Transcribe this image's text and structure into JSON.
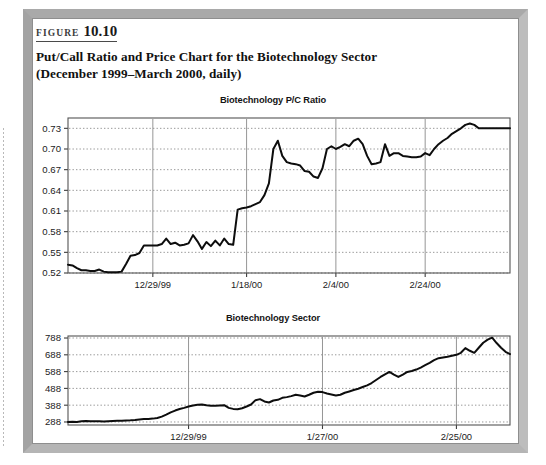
{
  "figure": {
    "label_word": "FIGURE",
    "number": "10.10",
    "title_line1": "Put/Call Ratio and Price Chart for the Biotechnology Sector",
    "title_line2": "(December 1999–March 2000, daily)"
  },
  "colors": {
    "frame_gray": "#a9a9a9",
    "line_black": "#0d0d0d",
    "grid_gray": "#8c8c8c",
    "text_black": "#111111"
  },
  "chart_data": [
    {
      "id": "biotech-pc-ratio",
      "type": "line",
      "title": "Biotechnology P/C Ratio",
      "xlabel": "",
      "ylabel": "",
      "grid": true,
      "legend": "none",
      "ylim": [
        0.52,
        0.745
      ],
      "ytick_labels": [
        "0.52",
        "0.55",
        "0.58",
        "0.61",
        "0.64",
        "0.67",
        "0.70",
        "0.73"
      ],
      "yticks": [
        0.52,
        0.55,
        0.58,
        0.61,
        0.64,
        0.67,
        0.7,
        0.73
      ],
      "xtick_labels": [
        "12/29/99",
        "1/18/00",
        "2/4/00",
        "2/24/00"
      ],
      "xtick_indices": [
        19,
        40,
        60,
        80
      ],
      "x_count": 100,
      "values": [
        0.532,
        0.531,
        0.527,
        0.524,
        0.524,
        0.523,
        0.523,
        0.525,
        0.522,
        0.521,
        0.521,
        0.521,
        0.522,
        0.533,
        0.545,
        0.546,
        0.549,
        0.56,
        0.56,
        0.56,
        0.56,
        0.562,
        0.57,
        0.562,
        0.564,
        0.56,
        0.561,
        0.563,
        0.575,
        0.566,
        0.555,
        0.565,
        0.559,
        0.567,
        0.56,
        0.57,
        0.562,
        0.561,
        0.612,
        0.614,
        0.615,
        0.617,
        0.62,
        0.623,
        0.633,
        0.65,
        0.7,
        0.712,
        0.69,
        0.681,
        0.679,
        0.678,
        0.676,
        0.668,
        0.667,
        0.66,
        0.658,
        0.672,
        0.7,
        0.704,
        0.7,
        0.703,
        0.707,
        0.704,
        0.712,
        0.715,
        0.707,
        0.69,
        0.678,
        0.679,
        0.681,
        0.707,
        0.69,
        0.694,
        0.694,
        0.69,
        0.689,
        0.688,
        0.688,
        0.689,
        0.694,
        0.691,
        0.7,
        0.707,
        0.712,
        0.716,
        0.722,
        0.726,
        0.73,
        0.735,
        0.737,
        0.735,
        0.73,
        0.73,
        0.73,
        0.73,
        0.73,
        0.73,
        0.73,
        0.73
      ]
    },
    {
      "id": "biotech-sector",
      "type": "line",
      "title": "Biotechnology Sector",
      "xlabel": "",
      "ylabel": "",
      "grid": true,
      "legend": "none",
      "ylim": [
        270,
        800
      ],
      "ytick_labels": [
        "288",
        "388",
        "488",
        "588",
        "688",
        "788"
      ],
      "yticks": [
        288,
        388,
        488,
        588,
        688,
        788
      ],
      "xtick_labels": [
        "12/29/99",
        "1/27/00",
        "2/25/00"
      ],
      "xtick_indices": [
        27,
        57,
        87
      ],
      "x_count": 100,
      "values": [
        288,
        289,
        288,
        292,
        294,
        293,
        292,
        292,
        291,
        293,
        294,
        295,
        296,
        297,
        298,
        300,
        303,
        305,
        306,
        308,
        312,
        320,
        332,
        345,
        356,
        365,
        372,
        380,
        386,
        390,
        392,
        388,
        385,
        384,
        386,
        388,
        372,
        366,
        364,
        370,
        380,
        392,
        418,
        424,
        410,
        404,
        416,
        420,
        432,
        436,
        442,
        450,
        446,
        440,
        450,
        462,
        468,
        466,
        458,
        452,
        446,
        450,
        462,
        470,
        478,
        486,
        496,
        506,
        520,
        538,
        556,
        572,
        586,
        570,
        556,
        570,
        586,
        592,
        600,
        612,
        626,
        640,
        656,
        668,
        672,
        676,
        682,
        688,
        700,
        728,
        712,
        700,
        730,
        760,
        778,
        790,
        758,
        730,
        706,
        692
      ]
    }
  ]
}
